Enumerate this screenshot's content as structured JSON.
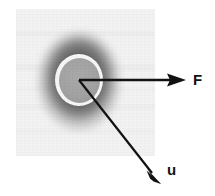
{
  "figure": {
    "background_color": "#ffffff",
    "panel": {
      "name": "micrograph-panel",
      "fill_color": "#f2f2f2",
      "x": 16,
      "y": 9,
      "width": 139,
      "height": 147
    },
    "particle": {
      "name": "particle-blob",
      "center_x": 79,
      "center_y": 80,
      "body_color": "#a2a2a2",
      "rim_color": "#f6f6f6",
      "halo_color": "#555555"
    },
    "vectors": [
      {
        "id": "force",
        "label": "F",
        "color": "#121212",
        "origin_x": 79,
        "origin_y": 80,
        "tip_x": 186,
        "tip_y": 80,
        "direction": "right",
        "angle_deg": 0
      },
      {
        "id": "velocity",
        "label": "u",
        "color": "#121212",
        "origin_x": 79,
        "origin_y": 80,
        "tip_x": 161,
        "tip_y": 184,
        "direction": "down-right",
        "angle_deg": -52
      }
    ]
  }
}
